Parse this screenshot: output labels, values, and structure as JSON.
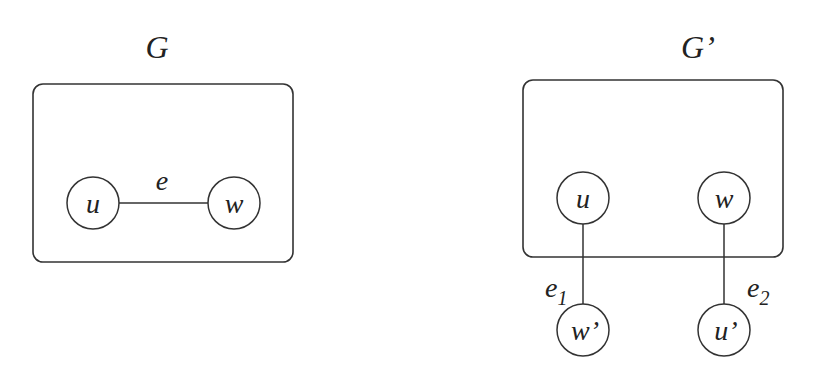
{
  "diagrams": [
    {
      "title": "G",
      "nodes": [
        {
          "id": "u",
          "label": "u"
        },
        {
          "id": "w",
          "label": "w"
        }
      ],
      "edges": [
        {
          "from": "u",
          "to": "w",
          "label": "e"
        }
      ]
    },
    {
      "title": "G’",
      "nodes": [
        {
          "id": "u",
          "label": "u"
        },
        {
          "id": "w",
          "label": "w"
        },
        {
          "id": "w_prime",
          "label": "w’"
        },
        {
          "id": "u_prime",
          "label": "u’"
        }
      ],
      "edges": [
        {
          "from": "u",
          "to": "w_prime",
          "label": "e",
          "subscript": "1"
        },
        {
          "from": "w",
          "to": "u_prime",
          "label": "e",
          "subscript": "2"
        }
      ]
    }
  ]
}
